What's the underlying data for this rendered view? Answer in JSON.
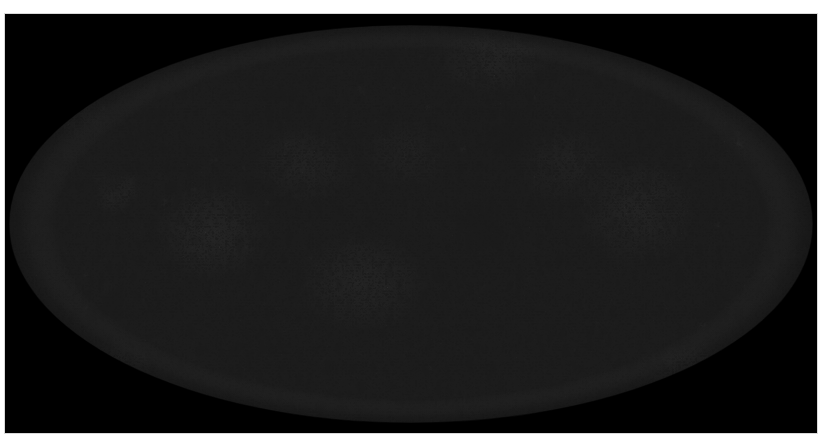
{
  "figure": {
    "kind": "all-sky-map",
    "title": "",
    "caption": "",
    "projection": "Mollweide",
    "colormap": "grayscale",
    "background_color": "#000000",
    "page_color": "#ffffff"
  },
  "frame": {
    "x": 5,
    "y": 14,
    "width": 812,
    "height": 419,
    "color": "#000000"
  },
  "ellipse": {
    "center_x": 406,
    "center_y": 210,
    "radius_x": 402,
    "radius_y": 200,
    "mean_gray": "#b4b4b4",
    "light_gray": "#e6e6e6",
    "dark_gray": "#2b2b2b"
  },
  "chart_data": {
    "type": "heatmap",
    "title": "",
    "subtitle": "",
    "xlabel": "",
    "ylabel": "",
    "projection": "Mollweide",
    "colormap": "grayscale",
    "legend": [],
    "grid": false,
    "annotations": [],
    "xlim": [
      -180,
      180
    ],
    "ylim": [
      -90,
      90
    ],
    "field_description": "Cosmic microwave background temperature anisotropy, full-sky Mollweide projection rendered in grayscale on a black rectangular background.",
    "noise": {
      "fine_grain_px": 1.2,
      "mid_structure_px": 14,
      "large_structure_px": 60,
      "value_range": [
        0.0,
        1.0
      ],
      "mean_level": 0.7
    },
    "hot_cold_blobs": [
      {
        "cx": 0.62,
        "cy": 0.29,
        "rx": 0.058,
        "ry": 0.11,
        "strength": -0.4,
        "label": "central-dark-cluster"
      },
      {
        "cx": 0.59,
        "cy": 0.505,
        "rx": 0.06,
        "ry": 0.14,
        "strength": -0.36,
        "label": "core-dark-patch"
      },
      {
        "cx": 0.128,
        "cy": 0.69,
        "rx": 0.048,
        "ry": 0.09,
        "strength": -0.34,
        "label": "lower-left-dark-blob"
      },
      {
        "cx": 0.175,
        "cy": 0.29,
        "rx": 0.06,
        "ry": 0.105,
        "strength": -0.28,
        "label": "upper-left-dark-band"
      },
      {
        "cx": 0.815,
        "cy": 0.245,
        "rx": 0.055,
        "ry": 0.1,
        "strength": -0.26,
        "label": "upper-right-dark-patch"
      },
      {
        "cx": 0.88,
        "cy": 0.715,
        "rx": 0.046,
        "ry": 0.095,
        "strength": -0.3,
        "label": "lower-right-dark-blob"
      },
      {
        "cx": 0.355,
        "cy": 0.205,
        "rx": 0.06,
        "ry": 0.09,
        "strength": -0.22,
        "label": "upper-mid-dark-wisp"
      },
      {
        "cx": 0.3,
        "cy": 0.8,
        "rx": 0.07,
        "ry": 0.09,
        "strength": -0.24,
        "label": "lower-mid-dark-streak"
      },
      {
        "cx": 0.47,
        "cy": 0.12,
        "rx": 0.055,
        "ry": 0.07,
        "strength": -0.18,
        "label": "top-dark-patch"
      },
      {
        "cx": 0.735,
        "cy": 0.13,
        "rx": 0.05,
        "ry": 0.07,
        "strength": -0.2,
        "label": "top-right-dark-patch"
      },
      {
        "cx": 0.068,
        "cy": 0.45,
        "rx": 0.04,
        "ry": 0.11,
        "strength": -0.2,
        "label": "left-limb-dark"
      },
      {
        "cx": 0.935,
        "cy": 0.46,
        "rx": 0.038,
        "ry": 0.105,
        "strength": -0.18,
        "label": "right-limb-dark"
      },
      {
        "cx": 0.255,
        "cy": 0.52,
        "rx": 0.07,
        "ry": 0.12,
        "strength": 0.22,
        "label": "left-bright-region"
      },
      {
        "cx": 0.44,
        "cy": 0.64,
        "rx": 0.08,
        "ry": 0.12,
        "strength": 0.2,
        "label": "lower-bright-region"
      },
      {
        "cx": 0.78,
        "cy": 0.47,
        "rx": 0.075,
        "ry": 0.13,
        "strength": 0.18,
        "label": "right-bright-region"
      },
      {
        "cx": 0.6,
        "cy": 0.11,
        "rx": 0.07,
        "ry": 0.08,
        "strength": 0.16,
        "label": "top-bright-region"
      },
      {
        "cx": 0.13,
        "cy": 0.86,
        "rx": 0.06,
        "ry": 0.08,
        "strength": 0.18,
        "label": "bottom-left-bright"
      }
    ]
  }
}
